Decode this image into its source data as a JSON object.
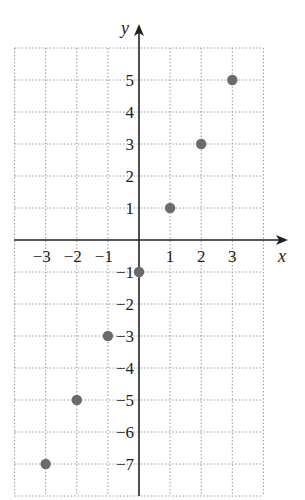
{
  "chart_data": {
    "type": "scatter",
    "title": "",
    "xlabel": "x",
    "ylabel": "y",
    "xlim": [
      -4,
      4
    ],
    "ylim": [
      -8,
      6
    ],
    "grid": true,
    "x_ticks": [
      -3,
      -2,
      -1,
      1,
      2,
      3
    ],
    "y_ticks": [
      5,
      4,
      3,
      2,
      1,
      -1,
      -2,
      -3,
      -4,
      -5,
      -6,
      -7
    ],
    "points": [
      {
        "x": -3,
        "y": -7
      },
      {
        "x": -2,
        "y": -5
      },
      {
        "x": -1,
        "y": -3
      },
      {
        "x": 0,
        "y": -1
      },
      {
        "x": 1,
        "y": 1
      },
      {
        "x": 2,
        "y": 3
      },
      {
        "x": 3,
        "y": 5
      }
    ],
    "colors": {
      "point": "#6b6b6b",
      "grid": "#9a9a9a",
      "axis": "#222222"
    }
  }
}
